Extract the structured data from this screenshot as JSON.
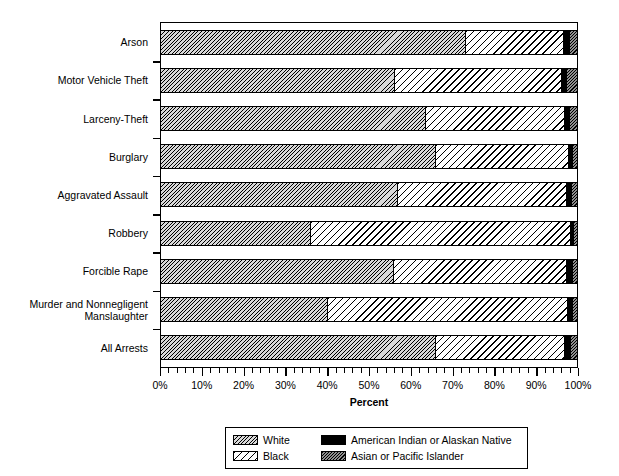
{
  "chart_data": {
    "type": "bar",
    "subtype": "stacked-horizontal-bar",
    "title": "",
    "xlabel": "Percent",
    "ylabel": "",
    "xlim": [
      0,
      100
    ],
    "xtick_labels": [
      "0%",
      "10%",
      "20%",
      "30%",
      "40%",
      "50%",
      "60%",
      "70%",
      "80%",
      "90%",
      "100%"
    ],
    "xtick_values": [
      0,
      10,
      20,
      30,
      40,
      50,
      60,
      70,
      80,
      90,
      100
    ],
    "minor_tick_interval": 2,
    "grid": false,
    "legend_position": "below-axis-center",
    "categories": [
      "Arson",
      "Motor Vehicle Theft",
      "Larceny-Theft",
      "Burglary",
      "Aggravated Assault",
      "Robbery",
      "Forcible Rape",
      "Murder and Nonnegligent Manslaughter",
      "All Arrests"
    ],
    "series": [
      {
        "name": "White",
        "fill": "dense-diagonal-hatch-gray",
        "color": "#d9d9d9",
        "values": [
          73.4,
          56.3,
          63.6,
          66.2,
          57.0,
          36.1,
          56.0,
          40.1,
          66.0
        ]
      },
      {
        "name": "Black",
        "fill": "wide-diagonal-hatch-white",
        "color": "#ffffff",
        "values": [
          23.5,
          40.2,
          33.6,
          31.8,
          40.5,
          62.4,
          41.7,
          57.7,
          31.2
        ]
      },
      {
        "name": "American Indian or Alaskan Native",
        "fill": "solid-black",
        "color": "#000000",
        "values": [
          1.3,
          1.2,
          1.2,
          1.1,
          1.2,
          0.7,
          1.3,
          1.2,
          1.3
        ]
      },
      {
        "name": "Asian or Pacific Islander",
        "fill": "medium-hatch-gray",
        "color": "#8f8f8f",
        "values": [
          1.8,
          2.3,
          1.6,
          0.9,
          1.3,
          0.8,
          1.0,
          1.0,
          1.5
        ]
      }
    ]
  },
  "legend": {
    "entries": [
      {
        "label": "White",
        "swatch": "white-hatch-swatch"
      },
      {
        "label": "American Indian or Alaskan Native",
        "swatch": "amerind-solid-swatch"
      },
      {
        "label": "Black",
        "swatch": "black-hatch-swatch"
      },
      {
        "label": "Asian or Pacific Islander",
        "swatch": "asian-hatch-swatch"
      }
    ]
  }
}
